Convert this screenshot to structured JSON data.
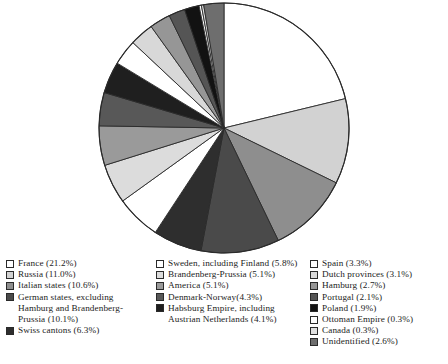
{
  "chart_data": {
    "type": "pie",
    "title": "",
    "subtitle": "",
    "start_angle_deg": 0,
    "direction": "clockwise",
    "legend_position": "bottom",
    "grid": false,
    "unit": "%",
    "categories": [
      "France",
      "Russia",
      "Italian states",
      "German states, excluding Hamburg and Brandenberg-Prussia",
      "Swiss cantons",
      "Sweden, including Finland",
      "Brandenberg-Prussia",
      "America",
      "Denmark-Norway",
      "Habsburg Empire, including Austrian Netherlands",
      "Spain",
      "Dutch provinces",
      "Hamburg",
      "Portugal",
      "Poland",
      "Ottoman Empire",
      "Canada",
      "Unidentified"
    ],
    "values": [
      21.2,
      11.0,
      10.6,
      10.1,
      6.3,
      5.8,
      5.1,
      5.1,
      4.3,
      4.1,
      3.3,
      3.1,
      2.7,
      2.1,
      1.9,
      0.3,
      0.3,
      2.6
    ],
    "colors": [
      "#ffffff",
      "#d2d2d2",
      "#8e8e8e",
      "#4a4a4a",
      "#2e2e2e",
      "#ffffff",
      "#dcdcdc",
      "#9a9a9a",
      "#585858",
      "#1f1f1f",
      "#ffffff",
      "#d8d8d8",
      "#969696",
      "#555555",
      "#121212",
      "#ffffff",
      "#e0e0e0",
      "#6e6e6e"
    ]
  },
  "legend": {
    "columns": [
      {
        "items": [
          {
            "label": "France (21.2%)",
            "swatch": "#ffffff"
          },
          {
            "label": "Russia (11.0%)",
            "swatch": "#d2d2d2"
          },
          {
            "label": "Italian states (10.6%)",
            "swatch": "#8e8e8e"
          },
          {
            "label": "German states, excluding\nHamburg and Brandenberg-\nPrussia (10.1%)",
            "swatch": "#4a4a4a"
          },
          {
            "label": "Swiss cantons (6.3%)",
            "swatch": "#2e2e2e"
          }
        ]
      },
      {
        "items": [
          {
            "label": "Sweden, including Finland (5.8%)",
            "swatch": "#ffffff"
          },
          {
            "label": "Brandenberg-Prussia (5.1%)",
            "swatch": "#dcdcdc"
          },
          {
            "label": "America (5.1%)",
            "swatch": "#9a9a9a"
          },
          {
            "label": "Denmark-Norway(4.3%)",
            "swatch": "#585858"
          },
          {
            "label": "Habsburg Empire, including\nAustrian Netherlands (4.1%)",
            "swatch": "#1f1f1f"
          }
        ]
      },
      {
        "items": [
          {
            "label": "Spain (3.3%)",
            "swatch": "#ffffff"
          },
          {
            "label": "Dutch provinces (3.1%)",
            "swatch": "#d8d8d8"
          },
          {
            "label": "Hamburg (2.7%)",
            "swatch": "#969696"
          },
          {
            "label": "Portugal (2.1%)",
            "swatch": "#555555"
          },
          {
            "label": "Poland (1.9%)",
            "swatch": "#121212"
          },
          {
            "label": "Ottoman Empire (0.3%)",
            "swatch": "#ffffff"
          },
          {
            "label": "Canada (0.3%)",
            "swatch": "#e0e0e0"
          },
          {
            "label": "Unidentified (2.6%)",
            "swatch": "#6e6e6e"
          }
        ]
      }
    ]
  },
  "caption": {
    "text": ""
  }
}
